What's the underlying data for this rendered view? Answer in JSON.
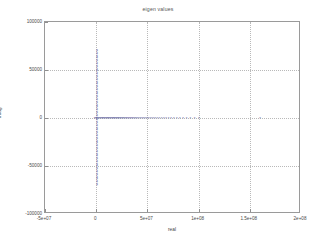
{
  "chart_data": {
    "type": "scatter",
    "title": "eigen values",
    "xlabel": "real",
    "ylabel": "imag",
    "xlim": [
      -50000000,
      200000000
    ],
    "ylim": [
      -100000,
      100000
    ],
    "grid": true,
    "legend": null,
    "marker": "x",
    "marker_color": "#5b5b9e",
    "xticks": [
      -50000000,
      0,
      50000000,
      100000000,
      150000000,
      200000000
    ],
    "xtick_labels": [
      "-5e+07",
      "0",
      "5e+07",
      "1e+08",
      "1.5e+08",
      "2e+08"
    ],
    "yticks": [
      -100000,
      -50000,
      0,
      50000,
      100000
    ],
    "ytick_labels": [
      "-100000",
      "-50000",
      "0",
      "50000",
      "100000"
    ],
    "series": [
      {
        "name": "eigenvalues",
        "points": [
          [
            900000,
            70500
          ],
          [
            900000,
            69000
          ],
          [
            900000,
            67500
          ],
          [
            900000,
            66000
          ],
          [
            900000,
            64500
          ],
          [
            900000,
            63000
          ],
          [
            900000,
            61500
          ],
          [
            900000,
            60000
          ],
          [
            900000,
            58500
          ],
          [
            900000,
            57000
          ],
          [
            900000,
            55500
          ],
          [
            900000,
            54000
          ],
          [
            900000,
            52500
          ],
          [
            900000,
            51000
          ],
          [
            900000,
            49500
          ],
          [
            900000,
            48000
          ],
          [
            900000,
            46500
          ],
          [
            900000,
            45000
          ],
          [
            900000,
            43500
          ],
          [
            900000,
            42000
          ],
          [
            900000,
            40500
          ],
          [
            900000,
            39000
          ],
          [
            900000,
            37500
          ],
          [
            900000,
            36000
          ],
          [
            900000,
            34500
          ],
          [
            900000,
            33000
          ],
          [
            900000,
            31500
          ],
          [
            900000,
            30000
          ],
          [
            900000,
            28500
          ],
          [
            900000,
            27000
          ],
          [
            900000,
            25500
          ],
          [
            900000,
            24000
          ],
          [
            900000,
            22500
          ],
          [
            900000,
            21000
          ],
          [
            900000,
            19500
          ],
          [
            900000,
            18000
          ],
          [
            900000,
            16500
          ],
          [
            900000,
            15000
          ],
          [
            900000,
            13500
          ],
          [
            900000,
            12000
          ],
          [
            900000,
            10500
          ],
          [
            900000,
            9000
          ],
          [
            900000,
            7500
          ],
          [
            900000,
            6000
          ],
          [
            900000,
            4500
          ],
          [
            900000,
            3000
          ],
          [
            900000,
            1500
          ],
          [
            900000,
            -1500
          ],
          [
            900000,
            -3000
          ],
          [
            900000,
            -4500
          ],
          [
            900000,
            -6000
          ],
          [
            900000,
            -7500
          ],
          [
            900000,
            -9000
          ],
          [
            900000,
            -10500
          ],
          [
            900000,
            -12000
          ],
          [
            900000,
            -13500
          ],
          [
            900000,
            -15000
          ],
          [
            900000,
            -16500
          ],
          [
            900000,
            -18000
          ],
          [
            900000,
            -19500
          ],
          [
            900000,
            -21000
          ],
          [
            900000,
            -22500
          ],
          [
            900000,
            -24000
          ],
          [
            900000,
            -25500
          ],
          [
            900000,
            -27000
          ],
          [
            900000,
            -28500
          ],
          [
            900000,
            -30000
          ],
          [
            900000,
            -31500
          ],
          [
            900000,
            -33000
          ],
          [
            900000,
            -34500
          ],
          [
            900000,
            -36000
          ],
          [
            900000,
            -37500
          ],
          [
            900000,
            -39000
          ],
          [
            900000,
            -40500
          ],
          [
            900000,
            -42000
          ],
          [
            900000,
            -43500
          ],
          [
            900000,
            -45000
          ],
          [
            900000,
            -46500
          ],
          [
            900000,
            -48000
          ],
          [
            900000,
            -49500
          ],
          [
            900000,
            -51000
          ],
          [
            900000,
            -52500
          ],
          [
            900000,
            -54000
          ],
          [
            900000,
            -55500
          ],
          [
            900000,
            -57000
          ],
          [
            900000,
            -58500
          ],
          [
            900000,
            -60000
          ],
          [
            900000,
            -61500
          ],
          [
            900000,
            -63000
          ],
          [
            900000,
            -64500
          ],
          [
            900000,
            -66000
          ],
          [
            900000,
            -67500
          ],
          [
            900000,
            -69000
          ],
          [
            900000,
            -70500
          ],
          [
            -1500000,
            0
          ],
          [
            -800000,
            0
          ],
          [
            0,
            0
          ],
          [
            600000,
            0
          ],
          [
            1200000,
            0
          ],
          [
            1900000,
            0
          ],
          [
            2600000,
            0
          ],
          [
            3300000,
            0
          ],
          [
            4000000,
            0
          ],
          [
            4700000,
            0
          ],
          [
            5400000,
            0
          ],
          [
            6100000,
            0
          ],
          [
            6800000,
            0
          ],
          [
            7500000,
            0
          ],
          [
            8200000,
            0
          ],
          [
            8900000,
            0
          ],
          [
            9600000,
            0
          ],
          [
            10300000,
            0
          ],
          [
            11000000,
            0
          ],
          [
            11700000,
            0
          ],
          [
            12400000,
            0
          ],
          [
            13100000,
            0
          ],
          [
            13800000,
            0
          ],
          [
            14500000,
            0
          ],
          [
            15200000,
            0
          ],
          [
            15900000,
            0
          ],
          [
            16600000,
            0
          ],
          [
            17300000,
            0
          ],
          [
            18000000,
            0
          ],
          [
            18700000,
            0
          ],
          [
            19400000,
            0
          ],
          [
            20100000,
            0
          ],
          [
            20800000,
            0
          ],
          [
            21500000,
            0
          ],
          [
            22200000,
            0
          ],
          [
            23000000,
            0
          ],
          [
            23800000,
            0
          ],
          [
            24600000,
            0
          ],
          [
            25400000,
            0
          ],
          [
            26200000,
            0
          ],
          [
            27000000,
            0
          ],
          [
            27900000,
            0
          ],
          [
            28800000,
            0
          ],
          [
            29700000,
            0
          ],
          [
            30600000,
            0
          ],
          [
            31500000,
            0
          ],
          [
            32500000,
            0
          ],
          [
            33500000,
            0
          ],
          [
            34500000,
            0
          ],
          [
            35500000,
            0
          ],
          [
            36600000,
            0
          ],
          [
            37700000,
            0
          ],
          [
            38800000,
            0
          ],
          [
            40000000,
            0
          ],
          [
            41200000,
            0
          ],
          [
            42500000,
            0
          ],
          [
            43800000,
            0
          ],
          [
            45200000,
            0
          ],
          [
            46600000,
            0
          ],
          [
            48000000,
            0
          ],
          [
            49500000,
            0
          ],
          [
            51000000,
            0
          ],
          [
            52600000,
            0
          ],
          [
            54300000,
            0
          ],
          [
            56000000,
            0
          ],
          [
            57800000,
            0
          ],
          [
            59700000,
            0
          ],
          [
            61700000,
            0
          ],
          [
            63800000,
            0
          ],
          [
            66000000,
            0
          ],
          [
            68300000,
            0
          ],
          [
            70700000,
            0
          ],
          [
            73200000,
            0
          ],
          [
            75900000,
            0
          ],
          [
            78700000,
            0
          ],
          [
            81700000,
            0
          ],
          [
            84900000,
            0
          ],
          [
            88300000,
            0
          ],
          [
            92000000,
            0
          ],
          [
            96000000,
            0
          ],
          [
            100500000,
            0
          ],
          [
            160000000,
            0
          ]
        ]
      }
    ]
  }
}
